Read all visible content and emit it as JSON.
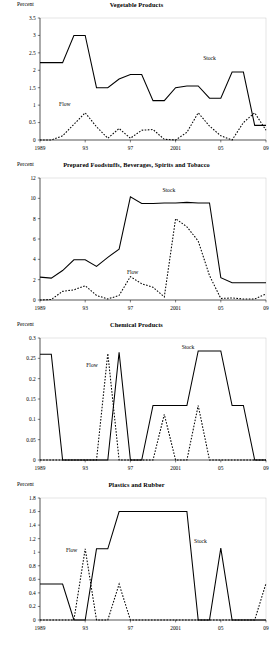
{
  "figure": {
    "ylabel_text": "Percent",
    "stock_label": "Stock",
    "flow_label": "Flow"
  },
  "chart_data": [
    {
      "type": "line",
      "title": "Vegetable Products",
      "ylabel": "Percent",
      "xlabel": "",
      "grid": false,
      "legend_position": "inline-annotations",
      "xlim": [
        1989,
        2009
      ],
      "ylim": [
        0,
        3.5
      ],
      "yticks": [
        0,
        0.5,
        1,
        1.5,
        2,
        2.5,
        3,
        3.5
      ],
      "ytick_labels": [
        "0",
        "0.5",
        "1",
        "1.5",
        "2",
        "2.5",
        "3",
        "3.5"
      ],
      "xticks": [
        1989,
        1993,
        1997,
        2001,
        2005,
        2009
      ],
      "xtick_labels": [
        "1989",
        "93",
        "97",
        "2001",
        "05",
        "09"
      ],
      "x": [
        1989,
        1990,
        1991,
        1992,
        1993,
        1994,
        1995,
        1996,
        1997,
        1998,
        1999,
        2000,
        2001,
        2002,
        2003,
        2004,
        2005,
        2006,
        2007,
        2008,
        2009
      ],
      "series": [
        {
          "name": "Stock",
          "style": "solid",
          "label_x": 2004,
          "label_y": 2.3,
          "values": [
            2.22,
            2.22,
            2.22,
            3.0,
            3.0,
            1.5,
            1.5,
            1.75,
            1.88,
            1.88,
            1.13,
            1.13,
            1.5,
            1.55,
            1.55,
            1.2,
            1.2,
            1.95,
            1.95,
            0.42,
            0.42
          ]
        },
        {
          "name": "Flow",
          "style": "dashed",
          "label_x": 1991.2,
          "label_y": 0.97,
          "values": [
            0.0,
            0.0,
            0.12,
            0.45,
            0.78,
            0.38,
            0.05,
            0.33,
            0.05,
            0.28,
            0.3,
            0.02,
            0.0,
            0.22,
            0.78,
            0.4,
            0.12,
            0.0,
            0.5,
            0.78,
            0.28
          ]
        }
      ]
    },
    {
      "type": "line",
      "title": "Prepared Foodstuffs, Beverages, Spirits and Tobacco",
      "ylabel": "Percent",
      "xlabel": "",
      "grid": false,
      "legend_position": "inline-annotations",
      "xlim": [
        1989,
        2009
      ],
      "ylim": [
        0,
        12
      ],
      "yticks": [
        0,
        2,
        4,
        6,
        8,
        10,
        12
      ],
      "ytick_labels": [
        "0",
        "2",
        "4",
        "6",
        "8",
        "10",
        "12"
      ],
      "xticks": [
        1989,
        1993,
        1997,
        2001,
        2005,
        2009
      ],
      "xtick_labels": [
        "1989",
        "93",
        "97",
        "2001",
        "05",
        "09"
      ],
      "x": [
        1989,
        1990,
        1991,
        1992,
        1993,
        1994,
        1995,
        1996,
        1997,
        1998,
        1999,
        2000,
        2001,
        2002,
        2003,
        2004,
        2005,
        2006,
        2007,
        2008,
        2009
      ],
      "series": [
        {
          "name": "Stock",
          "style": "solid",
          "label_x": 2000.4,
          "label_y": 10.6,
          "values": [
            2.25,
            2.15,
            2.9,
            3.95,
            3.95,
            3.3,
            4.2,
            5.0,
            10.15,
            9.5,
            9.5,
            9.55,
            9.55,
            9.6,
            9.55,
            9.55,
            2.2,
            1.7,
            1.7,
            1.7,
            1.7
          ]
        },
        {
          "name": "Flow",
          "style": "dashed",
          "label_x": 1997.2,
          "label_y": 2.6,
          "values": [
            0.0,
            0.05,
            0.85,
            1.0,
            1.4,
            0.45,
            0.1,
            0.45,
            2.3,
            1.6,
            1.25,
            0.3,
            8.0,
            7.2,
            5.8,
            2.4,
            0.15,
            0.2,
            0.1,
            0.1,
            0.6
          ]
        }
      ]
    },
    {
      "type": "line",
      "title": "Chemical Products",
      "ylabel": "Percent",
      "xlabel": "",
      "grid": false,
      "legend_position": "inline-annotations",
      "xlim": [
        1989,
        2009
      ],
      "ylim": [
        0,
        0.3
      ],
      "yticks": [
        0,
        0.05,
        0.1,
        0.15,
        0.2,
        0.25,
        0.3
      ],
      "ytick_labels": [
        "0",
        "0.05",
        "0.1",
        "0.15",
        "0.2",
        "0.25",
        "0.3"
      ],
      "xticks": [
        1989,
        1993,
        1997,
        2001,
        2005,
        2009
      ],
      "xtick_labels": [
        "1989",
        "93",
        "97",
        "2001",
        "05",
        "09"
      ],
      "x": [
        1989,
        1990,
        1991,
        1992,
        1993,
        1994,
        1995,
        1996,
        1997,
        1998,
        1999,
        2000,
        2001,
        2002,
        2003,
        2004,
        2005,
        2006,
        2007,
        2008,
        2009
      ],
      "series": [
        {
          "name": "Stock",
          "style": "solid",
          "label_x": 2002.1,
          "label_y": 0.272,
          "values": [
            0.26,
            0.26,
            0.0,
            0.0,
            0.0,
            0.0,
            0.0,
            0.265,
            0.0,
            0.0,
            0.134,
            0.134,
            0.134,
            0.134,
            0.268,
            0.268,
            0.268,
            0.134,
            0.134,
            0.0,
            0.0
          ]
        },
        {
          "name": "Flow",
          "style": "dashed",
          "label_x": 1993.6,
          "label_y": 0.228,
          "values": [
            0.0,
            0.0,
            0.0,
            0.0,
            0.0,
            0.0,
            0.262,
            0.0,
            0.0,
            0.0,
            0.0,
            0.112,
            0.0,
            0.0,
            0.134,
            0.0,
            0.0,
            0.0,
            0.0,
            0.0,
            0.0
          ]
        }
      ]
    },
    {
      "type": "line",
      "title": "Plastics and Rubber",
      "ylabel": "Percent",
      "xlabel": "",
      "grid": false,
      "legend_position": "inline-annotations",
      "xlim": [
        1989,
        2009
      ],
      "ylim": [
        0,
        1.8
      ],
      "yticks": [
        0,
        0.2,
        0.4,
        0.6,
        0.8,
        1,
        1.2,
        1.4,
        1.6,
        1.8
      ],
      "ytick_labels": [
        "0",
        "0.2",
        "0.4",
        "0.6",
        "0.8",
        "1",
        "1.2",
        "1.4",
        "1.6",
        "1.8"
      ],
      "xticks": [
        1989,
        1993,
        1997,
        2001,
        2005,
        2009
      ],
      "xtick_labels": [
        "1989",
        "93",
        "97",
        "2001",
        "05",
        "09"
      ],
      "x": [
        1989,
        1990,
        1991,
        1992,
        1993,
        1994,
        1995,
        1996,
        1997,
        1998,
        1999,
        2000,
        2001,
        2002,
        2003,
        2004,
        2005,
        2006,
        2007,
        2008,
        2009
      ],
      "series": [
        {
          "name": "Stock",
          "style": "solid",
          "label_x": 2003.2,
          "label_y": 1.14,
          "values": [
            0.53,
            0.53,
            0.53,
            0.0,
            0.0,
            1.05,
            1.05,
            1.6,
            1.6,
            1.6,
            1.6,
            1.6,
            1.6,
            1.6,
            0.0,
            0.0,
            1.06,
            0.0,
            0.0,
            0.0,
            0.0
          ]
        },
        {
          "name": "Flow",
          "style": "dashed",
          "label_x": 1991.8,
          "label_y": 1.0,
          "values": [
            0.0,
            0.0,
            0.0,
            0.0,
            1.05,
            0.0,
            0.0,
            0.53,
            0.0,
            0.0,
            0.0,
            0.0,
            0.0,
            0.0,
            0.0,
            0.0,
            0.0,
            0.0,
            0.0,
            0.0,
            0.54
          ]
        }
      ]
    }
  ]
}
